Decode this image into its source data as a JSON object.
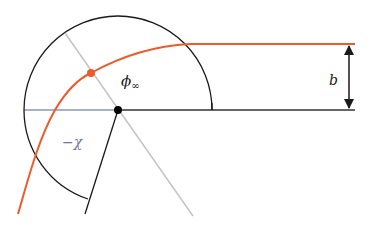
{
  "diagram": {
    "type": "scattering-geometry",
    "labels": {
      "phi_inf": "ϕ",
      "phi_inf_sub": "∞",
      "neg_chi": "−χ",
      "impact_b": "b"
    },
    "colors": {
      "trajectory": "#f05a2a",
      "arc": "#1a1a1a",
      "axis_gray": "#c4c4c4",
      "baseline_left": "#8a98b8",
      "baseline_right": "#333333",
      "chi_label": "#6a77a3",
      "dot_center": "#000000",
      "dot_orbit": "#f05a2a"
    },
    "elements": {
      "center": {
        "x": 118,
        "y": 110
      },
      "arc_radius": 94,
      "orbit_point": {
        "x": 91,
        "y": 73
      },
      "incoming_asymptote_y": 44,
      "impact_parameter_arrow_x": 349
    }
  }
}
